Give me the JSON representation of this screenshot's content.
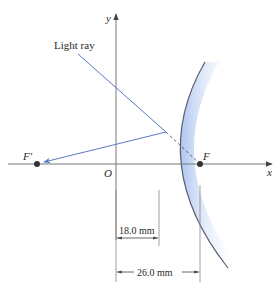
{
  "diagram": {
    "type": "convex-mirror-ray-diagram",
    "labels": {
      "y_axis": "y",
      "x_axis": "x",
      "origin": "O",
      "focal_point": "F",
      "virtual_focal_point": "F′",
      "light_ray": "Light ray"
    },
    "dimensions": {
      "mirror_distance": "18.0 mm",
      "focal_distance": "26.0 mm"
    },
    "colors": {
      "ray": "#5b79c4",
      "axis": "#777777",
      "mirror_edge": "#5a5f70",
      "mirror_fill": "#bcd0f2"
    }
  }
}
